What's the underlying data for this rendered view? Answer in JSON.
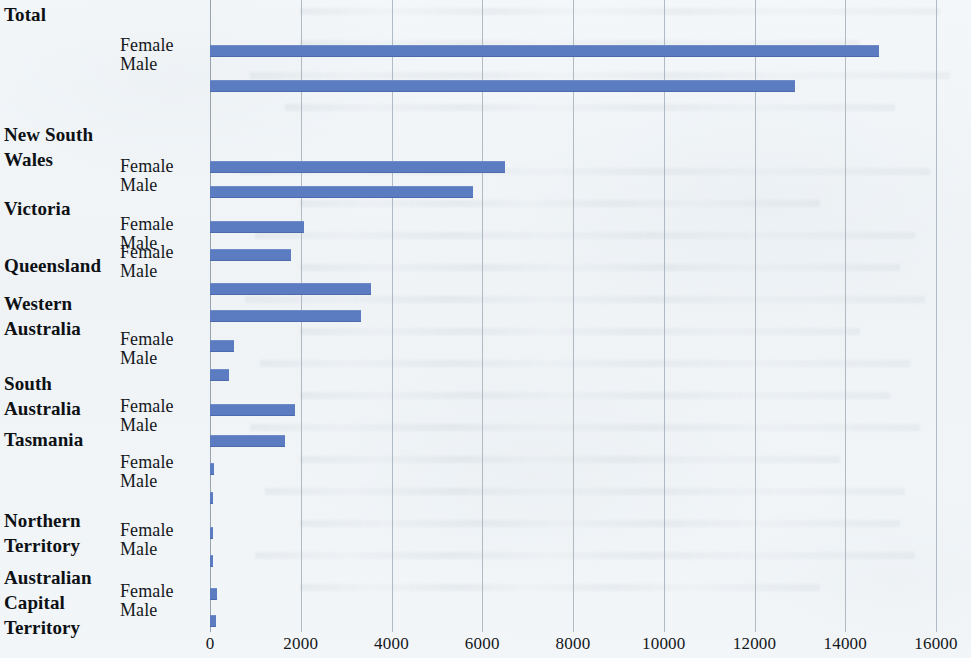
{
  "chart_data": {
    "type": "bar",
    "orientation": "horizontal",
    "title": "",
    "subtitle": "",
    "xlabel": "",
    "ylabel": "",
    "xlim": [
      0,
      16000
    ],
    "grid": true,
    "legend": "none",
    "series_names": [
      "Female",
      "Male"
    ],
    "axis_ticks": [
      {
        "value": 0,
        "label": "0"
      },
      {
        "value": 2000,
        "label": "2000"
      },
      {
        "value": 4000,
        "label": "4000"
      },
      {
        "value": 6000,
        "label": "6000"
      },
      {
        "value": 8000,
        "label": "8000"
      },
      {
        "value": 10000,
        "label": "10000"
      },
      {
        "value": 12000,
        "label": "12000"
      },
      {
        "value": 14000,
        "label": "14000"
      },
      {
        "value": 16000,
        "label": "16000"
      }
    ],
    "categories": [
      "Total",
      "New South Wales",
      "Victoria",
      "Queensland",
      "Western Australia",
      "South Australia",
      "Tasmania",
      "Northern Territory",
      "Australian Capital Territory"
    ],
    "series": [
      {
        "name": "Female",
        "values": [
          14750,
          6500,
          2080,
          3540,
          530,
          1870,
          90,
          70,
          160
        ]
      },
      {
        "name": "Male",
        "values": [
          12900,
          5800,
          1790,
          3330,
          420,
          1650,
          60,
          50,
          130
        ]
      }
    ],
    "bar_color": "#5c7cc2",
    "gridline_color": "#9aa7b3",
    "background_color": "#f1f4f7"
  },
  "groups": [
    {
      "label_lines": [
        "Total"
      ],
      "label_top": 2,
      "female_bar_top": 45,
      "male_bar_top": 80,
      "series_label_top": 36,
      "female": 14750,
      "male": 12900
    },
    {
      "label_lines": [
        "New South",
        "Wales"
      ],
      "label_top": 122,
      "female_bar_top": 161,
      "male_bar_top": 186,
      "series_label_top": 157,
      "female": 6500,
      "male": 5800
    },
    {
      "label_lines": [
        "Victoria"
      ],
      "label_top": 196,
      "female_bar_top": 221,
      "male_bar_top": 249,
      "series_label_top": 215,
      "female": 2080,
      "male": 1790
    },
    {
      "label_lines": [
        "Queensland"
      ],
      "label_top": 253,
      "female_bar_top": 283,
      "male_bar_top": 310,
      "series_label_top": 243,
      "female": 3540,
      "male": 3330
    },
    {
      "label_lines": [
        "Western",
        "Australia"
      ],
      "label_top": 291,
      "female_bar_top": 340,
      "male_bar_top": 369,
      "series_label_top": 330,
      "female": 530,
      "male": 420
    },
    {
      "label_lines": [
        "South",
        "Australia"
      ],
      "label_top": 371,
      "female_bar_top": 404,
      "male_bar_top": 435,
      "series_label_top": 397,
      "female": 1870,
      "male": 1650
    },
    {
      "label_lines": [
        "Tasmania"
      ],
      "label_top": 427,
      "female_bar_top": 463,
      "male_bar_top": 492,
      "series_label_top": 453,
      "female": 90,
      "male": 60
    },
    {
      "label_lines": [
        "Northern",
        "Territory"
      ],
      "label_top": 508,
      "female_bar_top": 527,
      "male_bar_top": 555,
      "series_label_top": 521,
      "female": 70,
      "male": 50
    },
    {
      "label_lines": [
        "Australian",
        "Capital",
        "Territory"
      ],
      "label_top": 565,
      "female_bar_top": 588,
      "male_bar_top": 615,
      "series_label_top": 582,
      "female": 160,
      "male": 130
    }
  ],
  "series_labels": {
    "female": "Female",
    "male": "Male"
  }
}
